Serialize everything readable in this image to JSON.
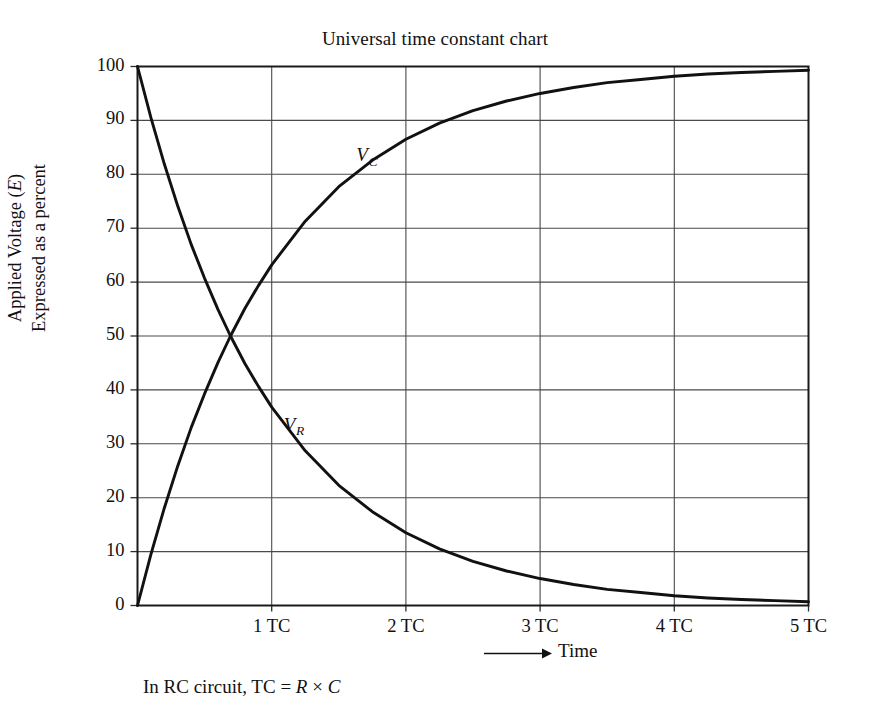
{
  "figure": {
    "title": "Universal time constant chart",
    "y_axis_title_line1": "Applied Voltage (",
    "y_axis_title_line1_italic": "E",
    "y_axis_title_line1_end": ")",
    "y_axis_title_line2": "Expressed as a percent",
    "x_axis_label": "Time",
    "x_axis_arrow": "arrow-right-icon",
    "footnote_prefix": "In RC circuit, TC = ",
    "footnote_r": "R",
    "footnote_times": " × ",
    "footnote_c": "C"
  },
  "chart_data": {
    "type": "line",
    "title": "Universal time constant chart",
    "xlabel": "Time",
    "ylabel": "Applied Voltage (E) Expressed as a percent",
    "xlim": [
      0,
      5
    ],
    "ylim": [
      0,
      100
    ],
    "grid": true,
    "legend": "inline-curve-labels",
    "x_tick_labels": [
      "1 TC",
      "2 TC",
      "3 TC",
      "4 TC",
      "5 TC"
    ],
    "x_tick_values": [
      1,
      2,
      3,
      4,
      5
    ],
    "y_tick_labels": [
      "0",
      "10",
      "20",
      "30",
      "40",
      "50",
      "60",
      "70",
      "80",
      "90",
      "100"
    ],
    "y_tick_values": [
      0,
      10,
      20,
      30,
      40,
      50,
      60,
      70,
      80,
      90,
      100
    ],
    "x": [
      0,
      0.1,
      0.2,
      0.3,
      0.4,
      0.5,
      0.6,
      0.693,
      0.8,
      0.9,
      1,
      1.25,
      1.5,
      1.75,
      2,
      2.25,
      2.5,
      2.75,
      3,
      3.25,
      3.5,
      3.75,
      4,
      4.25,
      4.5,
      4.75,
      5
    ],
    "series": [
      {
        "name": "V_C",
        "label": "VC",
        "label_at": {
          "x": 1.72,
          "y": 83
        },
        "description": "Capacitor voltage, charging curve 100*(1-e^-t)",
        "values": [
          0,
          9.5,
          18.1,
          25.9,
          33,
          39.3,
          45.1,
          50,
          55.1,
          59.3,
          63.2,
          71.3,
          77.7,
          82.6,
          86.5,
          89.5,
          91.8,
          93.6,
          95,
          96.1,
          97,
          97.6,
          98.2,
          98.6,
          98.9,
          99.1,
          99.3
        ]
      },
      {
        "name": "V_R",
        "label": "VR",
        "label_at": {
          "x": 1.18,
          "y": 33
        },
        "description": "Resistor voltage, discharging curve 100*e^-t",
        "values": [
          100,
          90.5,
          81.9,
          74.1,
          67,
          60.7,
          54.9,
          50,
          44.9,
          40.7,
          36.8,
          28.7,
          22.3,
          17.4,
          13.5,
          10.5,
          8.2,
          6.4,
          5,
          3.9,
          3,
          2.4,
          1.8,
          1.4,
          1.1,
          0.9,
          0.7
        ]
      }
    ]
  }
}
